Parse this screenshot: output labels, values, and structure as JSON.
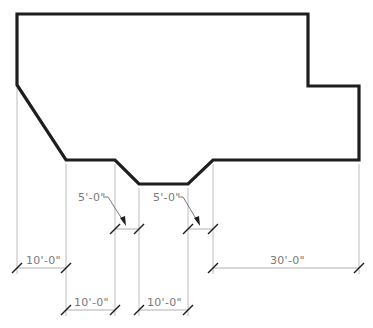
{
  "drawing": {
    "type": "architectural-floor-plan-outline",
    "outline_points": "17,14 308,14 308,86 359,86 359,160 213,160 188,184 139,184 115,160 66,160 17,85",
    "stroke_color": "#1e1e1e",
    "dimension_color": "#a8a8a8"
  },
  "dimensions": [
    {
      "id": "left-10ft",
      "label": "10'-0\"",
      "x1": 17,
      "x2": 66,
      "y": 268
    },
    {
      "id": "bottom-left-10ft",
      "label": "10'-0\"",
      "x1": 66,
      "x2": 115,
      "y": 310
    },
    {
      "id": "bottom-mid-10ft",
      "label": "10'-0\"",
      "x1": 139,
      "x2": 188,
      "y": 310
    },
    {
      "id": "right-30ft",
      "label": "30'-0\"",
      "x1": 213,
      "x2": 359,
      "y": 268
    },
    {
      "id": "notch-left-5ft",
      "label": "5'-0\"",
      "x1": 115,
      "x2": 139,
      "y": 228
    },
    {
      "id": "notch-right-5ft",
      "label": "5'-0\"",
      "x1": 188,
      "x2": 213,
      "y": 228
    }
  ],
  "labels": {
    "left_10": "10'-0\"",
    "bottom_left_10": "10'-0\"",
    "bottom_mid_10": "10'-0\"",
    "right_30": "30'-0\"",
    "notch_left_5": "5'-0\"",
    "notch_right_5": "5'-0\""
  }
}
